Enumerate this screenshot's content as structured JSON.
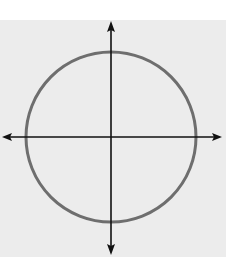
{
  "figure": {
    "axes": {
      "x_label": "x",
      "y_label": "y",
      "origin_label": "O",
      "tick_labels": {
        "x_pos": "1",
        "x_neg": "−1",
        "y_pos": "1",
        "y_neg": "−1"
      }
    },
    "grid": {
      "x_range": [
        -4,
        4
      ],
      "y_range": [
        -4,
        4
      ],
      "step": 1
    },
    "circle": {
      "center": [
        0,
        0
      ],
      "radius": 3
    },
    "octagon": {
      "vertices": [
        [
          -1.24,
          3
        ],
        [
          1.24,
          3
        ],
        [
          3,
          1.24
        ],
        [
          3,
          -1.24
        ],
        [
          1.24,
          -3
        ],
        [
          -1.24,
          -3
        ],
        [
          -3,
          -1.24
        ],
        [
          -3,
          1.24
        ]
      ]
    },
    "colors": {
      "background": "#ffffff",
      "grid_fill": "#ececec",
      "grid_line": "#a9a9a9",
      "axis": "#111111",
      "shape_stroke": "#6e6e6e"
    }
  }
}
